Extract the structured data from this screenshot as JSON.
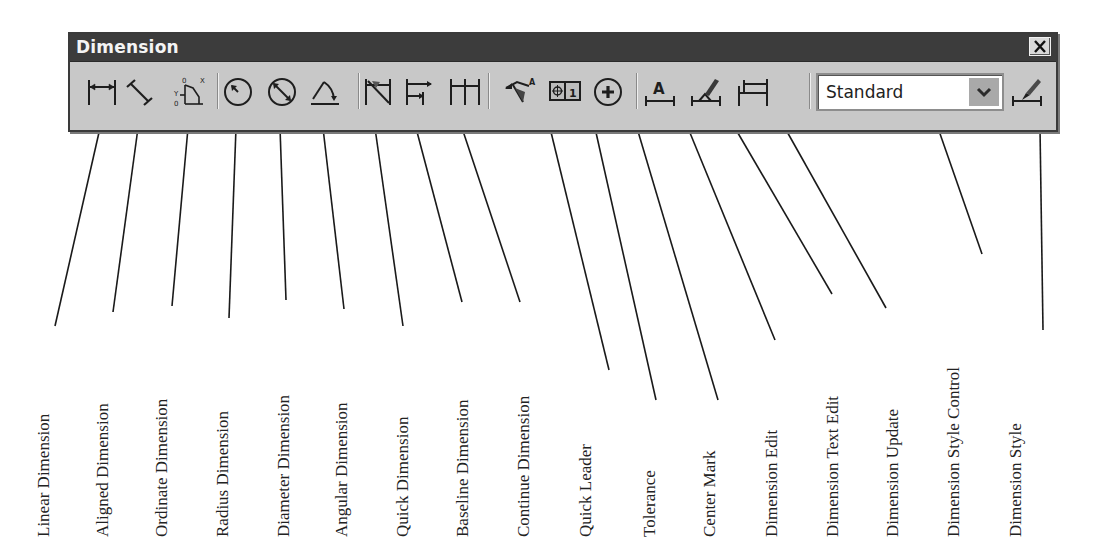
{
  "window": {
    "title": "Dimension",
    "close_label": "Close"
  },
  "toolbar": {
    "tools": [
      {
        "id": "linear",
        "icon": "linear-dimension-icon",
        "label": "Linear Dimension"
      },
      {
        "id": "aligned",
        "icon": "aligned-dimension-icon",
        "label": "Aligned Dimension"
      },
      {
        "id": "ordinate",
        "icon": "ordinate-dimension-icon",
        "label": "Ordinate Dimension"
      },
      {
        "id": "radius",
        "icon": "radius-dimension-icon",
        "label": "Radius Dimension"
      },
      {
        "id": "diameter",
        "icon": "diameter-dimension-icon",
        "label": "Diameter Dimension"
      },
      {
        "id": "angular",
        "icon": "angular-dimension-icon",
        "label": "Angular Dimension"
      },
      {
        "id": "quick-dim",
        "icon": "quick-dimension-icon",
        "label": "Quick Dimension"
      },
      {
        "id": "baseline",
        "icon": "baseline-dimension-icon",
        "label": "Baseline Dimension"
      },
      {
        "id": "continue",
        "icon": "continue-dimension-icon",
        "label": "Continue Dimension"
      },
      {
        "id": "quick-leader",
        "icon": "quick-leader-icon",
        "label": "Quick Leader"
      },
      {
        "id": "tolerance",
        "icon": "tolerance-icon",
        "label": "Tolerance"
      },
      {
        "id": "center-mark",
        "icon": "center-mark-icon",
        "label": "Center Mark"
      },
      {
        "id": "dim-edit",
        "icon": "dimension-edit-icon",
        "label": "Dimension Edit"
      },
      {
        "id": "dim-text-edit",
        "icon": "dimension-text-edit-icon",
        "label": "Dimension Text Edit"
      },
      {
        "id": "dim-update",
        "icon": "dimension-update-icon",
        "label": "Dimension Update"
      }
    ],
    "style_control": {
      "value": "Standard",
      "label": "Dimension Style Control"
    },
    "dim_style": {
      "icon": "dimension-style-icon",
      "label": "Dimension Style"
    },
    "ordinate_glyphs": {
      "x": "X",
      "y": "Y",
      "zero": "0"
    },
    "tolerance_glyph": "1",
    "text_glyph": "A"
  },
  "callout_labels": [
    "Linear Dimension",
    "Aligned Dimension",
    "Ordinate Dimension",
    "Radius Dimension",
    "Diameter Dimension",
    "Angular Dimension",
    "Quick Dimension",
    "Baseline Dimension",
    "Continue Dimension",
    "Quick Leader",
    "Tolerance",
    "Center Mark",
    "Dimension Edit",
    "Dimension Text Edit",
    "Dimension Update",
    "Dimension Style Control",
    "Dimension Style"
  ],
  "colors": {
    "toolbar_bg": "#c8c8c8",
    "titlebar_bg": "#3c3c3c",
    "title_text": "#f4f4f4",
    "icon": "#1e1e1e",
    "dropdown_arrow_bg": "#a9a9a9",
    "page_bg": "#ffffff"
  }
}
